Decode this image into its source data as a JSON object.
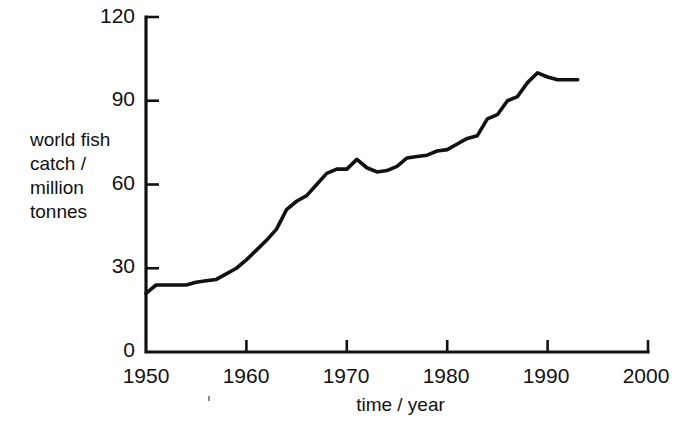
{
  "chart_data": {
    "type": "line",
    "title": "",
    "xlabel": "time / year",
    "ylabel": "world fish catch / million tonnes",
    "ylabel_lines": [
      "world fish",
      "catch /",
      "million",
      "tonnes"
    ],
    "xlim": [
      1950,
      2000
    ],
    "ylim": [
      0,
      120
    ],
    "xticks": [
      1950,
      1960,
      1970,
      1980,
      1990,
      2000
    ],
    "yticks": [
      0,
      30,
      60,
      90,
      120
    ],
    "xtick_labels": [
      "1950",
      "1960",
      "1970",
      "1980",
      "1990",
      "2000"
    ],
    "ytick_labels": [
      "0",
      "30",
      "60",
      "90",
      "120"
    ],
    "grid": false,
    "legend": false,
    "series": [
      {
        "name": "world fish catch",
        "color": "#111111",
        "x": [
          1950,
          1951,
          1952,
          1953,
          1954,
          1955,
          1956,
          1957,
          1958,
          1959,
          1960,
          1961,
          1962,
          1963,
          1964,
          1965,
          1966,
          1967,
          1968,
          1969,
          1970,
          1971,
          1972,
          1973,
          1974,
          1975,
          1976,
          1977,
          1978,
          1979,
          1980,
          1981,
          1982,
          1983,
          1984,
          1985,
          1986,
          1987,
          1988,
          1989,
          1990,
          1991,
          1992,
          1993
        ],
        "values": [
          21,
          24,
          24,
          24,
          24,
          25,
          25.5,
          26,
          28,
          30,
          33,
          36.5,
          40,
          44,
          51,
          54,
          56,
          60,
          64,
          65.5,
          65.5,
          69,
          66,
          64.5,
          65,
          66.5,
          69.5,
          70,
          70.5,
          72,
          72.5,
          74.5,
          76.5,
          77.5,
          83.5,
          85,
          90,
          91.5,
          96.5,
          100,
          98.5,
          97.5,
          97.5,
          97.5
        ]
      }
    ]
  },
  "axis": {
    "y_label_text": "world fish\ncatch /\nmillion\ntonnes",
    "x_label_text": "time / year"
  }
}
